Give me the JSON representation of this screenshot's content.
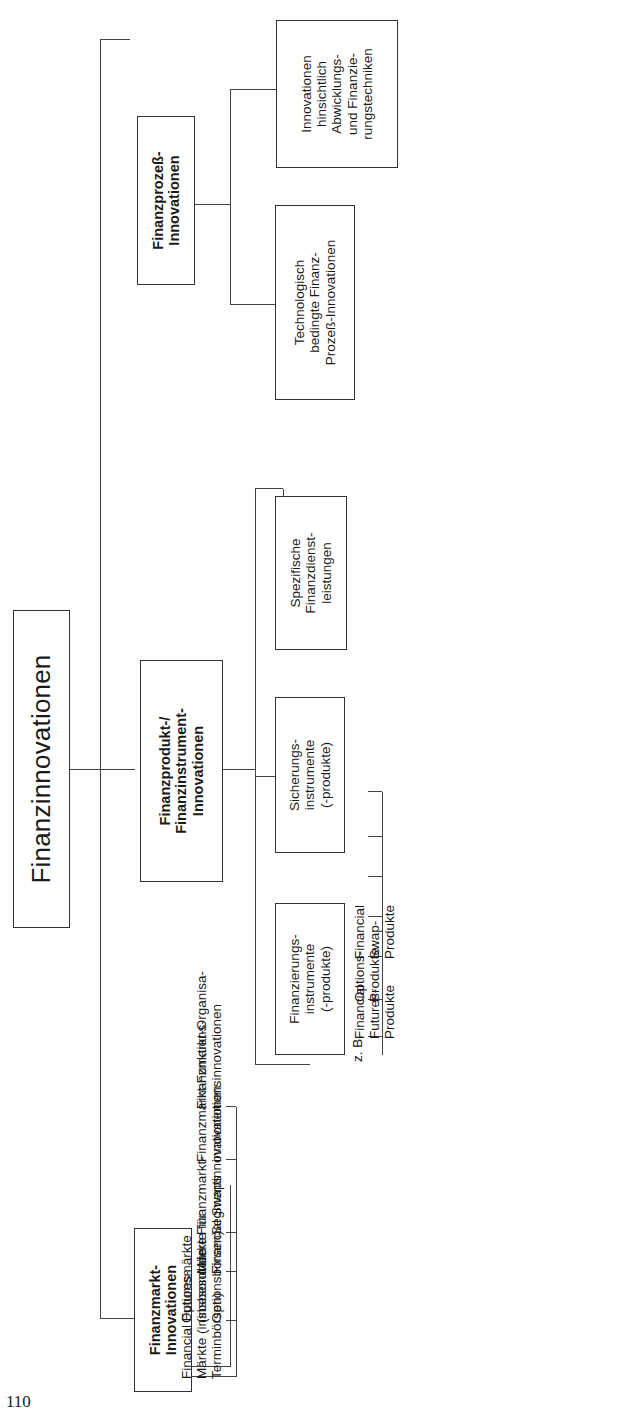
{
  "page_number": "110",
  "root": {
    "label": "Finanzinnovationen"
  },
  "branches": [
    {
      "label": "Finanzmarkt-\nInnovationen",
      "items": [
        "Financial Futures-\nMärkte (insbesondere\nTerminbörsen)",
        "Optionsmärkte\n(insbesondere\nOptionsbörsen)",
        "Märkte für\nFinancial Swaps",
        "Finanzmarkt-\nSegmentinnovationen",
        "Finanzmarkt-Funktions-\ninnovationen",
        "Finanzmarkt-Organisa-\ntionsinnovationen"
      ]
    },
    {
      "label": "Finanzprodukt-/\nFinanzinstrument-\nInnovationen",
      "groups": [
        {
          "label": "Finanzierungs-\ninstrumente\n(-produkte)",
          "prefix": "z. B.",
          "items": [
            "FRN; Roll-over",
            "RUF; NiF; CP; CD",
            "ABS-Finance",
            "Stripped Bonds",
            "Zero Bonds",
            "Vendor",
            "Venture Capital"
          ]
        },
        {
          "label": "Sicherungs-\ninstrumente\n(-produkte)",
          "items": [
            "Financial\nFutures-\nProdukte",
            "Options-\nProdukte",
            "Financial\nSwap-\nProdukte"
          ]
        },
        {
          "label": "Spezifische\nFinanzdienst-\nleistungen",
          "prefix": "z. B.",
          "items": [
            "Portfolio-\nManagement",
            "Portfolio-\nInsurance",
            "Unterstützung\nbei Emissionen",
            "Progamm-\nfinanzierungen"
          ]
        }
      ]
    },
    {
      "label": "Finanzprozeß-\nInnovationen",
      "groups": [
        {
          "label": "Technologisch\nbedingte Finanz-\nProzeß-Innovationen",
          "prefix": "z. B.",
          "items": [
            "Electronic\nBanking",
            "Electronic\nCash (POS)",
            "Cash-Manage-\nment-Systeme"
          ]
        },
        {
          "label": "Innovationen\nhinsichtlich\nAbwicklungs-\nund Finanzie-\nrungstechniken",
          "prefix": "z. B.",
          "items": [
            "Securitisation",
            "Pooling",
            "Netting",
            "Co-Branding"
          ]
        }
      ]
    }
  ],
  "colors": {
    "line": "#444444",
    "text": "#1a1a1a",
    "background": "#fdfdfd"
  }
}
